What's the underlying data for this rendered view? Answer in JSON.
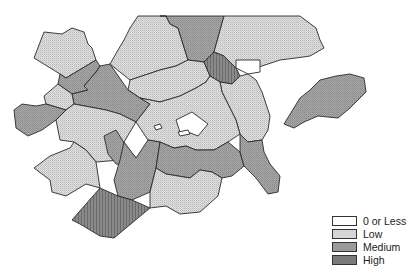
{
  "map": {
    "type": "choropleth",
    "colors": {
      "zero_or_less": "#ffffff",
      "low": "#d6d6d6",
      "medium": "#9a9a9a",
      "high": "#7a7a7a",
      "border": "#2a2a2a"
    }
  },
  "legend": {
    "items": [
      {
        "label": "0 or Less",
        "key": "zero_or_less",
        "color": "#ffffff"
      },
      {
        "label": "Low",
        "key": "low",
        "color": "#d6d6d6"
      },
      {
        "label": "Medium",
        "key": "medium",
        "color": "#9a9a9a"
      },
      {
        "label": "High",
        "key": "high",
        "color": "#7a7a7a"
      }
    ]
  }
}
